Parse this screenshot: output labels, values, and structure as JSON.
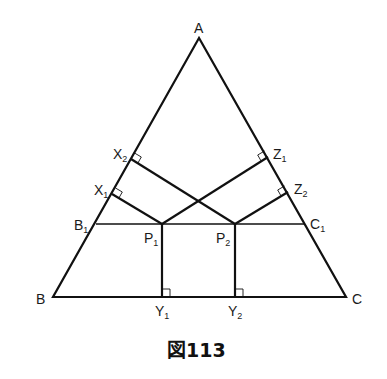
{
  "figure": {
    "caption": "図113",
    "points": {
      "A": {
        "label": "A",
        "sub": ""
      },
      "B": {
        "label": "B",
        "sub": ""
      },
      "C": {
        "label": "C",
        "sub": ""
      },
      "B1": {
        "label": "B",
        "sub": "1"
      },
      "C1": {
        "label": "C",
        "sub": "1"
      },
      "P1": {
        "label": "P",
        "sub": "1"
      },
      "P2": {
        "label": "P",
        "sub": "2"
      },
      "X1": {
        "label": "X",
        "sub": "1"
      },
      "X2": {
        "label": "X",
        "sub": "2"
      },
      "Y1": {
        "label": "Y",
        "sub": "1"
      },
      "Y2": {
        "label": "Y",
        "sub": "2"
      },
      "Z1": {
        "label": "Z",
        "sub": "1"
      },
      "Z2": {
        "label": "Z",
        "sub": "2"
      }
    }
  }
}
